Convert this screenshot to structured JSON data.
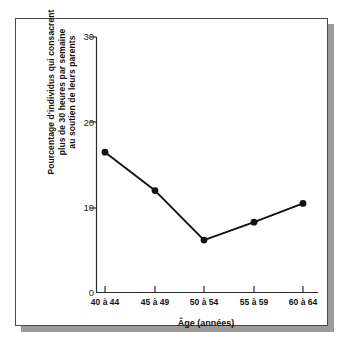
{
  "figure": {
    "frame_color": "#4a4a4a",
    "shadow_color": "#9a9a9a",
    "background": "#ffffff",
    "ink_color": "#111111"
  },
  "chart_data": {
    "type": "line",
    "title": "",
    "subtitle": "",
    "xlabel": "Âge (années)",
    "ylabel": "Pourcentage d'individus qui consacrent plus de 30 heures par semaine au soutien de leurs parents",
    "ylabel_lines": [
      "Pourcentage d'individus qui consacrent",
      "plus de 30 heures par semaine",
      "au soutien de leurs parents"
    ],
    "categories": [
      "40 à 44",
      "45 à 49",
      "50 à 54",
      "55 à 59",
      "60 à 64"
    ],
    "values": [
      16.5,
      12.0,
      6.2,
      8.3,
      10.5
    ],
    "series": [
      {
        "name": "Pourcentage d'individus",
        "values": [
          16.5,
          12.0,
          6.2,
          8.3,
          10.5
        ],
        "marker": "circle",
        "marker_color": "#111111",
        "line_color": "#111111"
      }
    ],
    "ylim": [
      0,
      30
    ],
    "yticks": [
      0,
      10,
      20,
      30
    ],
    "ytick_labels": [
      "0",
      "10",
      "20",
      "30"
    ],
    "xtick_labels": [
      "40 à 44",
      "45 à 49",
      "50 à 54",
      "55 à 59",
      "60 à 64"
    ],
    "grid": false,
    "legend": false,
    "legend_position": "none"
  }
}
